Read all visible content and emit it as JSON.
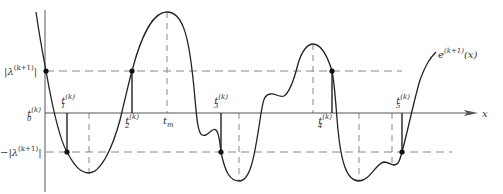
{
  "diagram": {
    "type": "error-curve-alternation",
    "curve_label": "e^{(k+1)}(x)",
    "curve_label_parts": {
      "base": "e",
      "sup": "(k+1)",
      "arg": "(x)"
    },
    "x_axis_label": "x",
    "upper_level_label": {
      "bar": "|",
      "base": "λ",
      "sup": "(k+1)",
      "bar_end": "|"
    },
    "lower_level_label": {
      "prefix": "−|",
      "base": "λ",
      "sup": "(k+1)",
      "bar_end": "|"
    },
    "points": [
      {
        "id": "t0",
        "base": "t",
        "sub": "0",
        "sup": "(k)",
        "level": "upper"
      },
      {
        "id": "t1",
        "base": "t",
        "sub": "1",
        "sup": "(k)",
        "level": "lower"
      },
      {
        "id": "t2",
        "base": "t",
        "sub": "2",
        "sup": "(k)",
        "level": "upper"
      },
      {
        "id": "t3",
        "base": "t",
        "sub": "3",
        "sup": "(k)",
        "level": "lower"
      },
      {
        "id": "t4",
        "base": "t",
        "sub": "4",
        "sup": "(k)",
        "level": "upper"
      },
      {
        "id": "t5",
        "base": "t",
        "sub": "5",
        "sup": "(k)",
        "level": "lower"
      }
    ],
    "tm_label": {
      "base": "t",
      "sub": "m"
    },
    "colors": {
      "curve": "#222222",
      "axis": "#444444",
      "dashed": "#888888",
      "text": "#333333"
    }
  }
}
